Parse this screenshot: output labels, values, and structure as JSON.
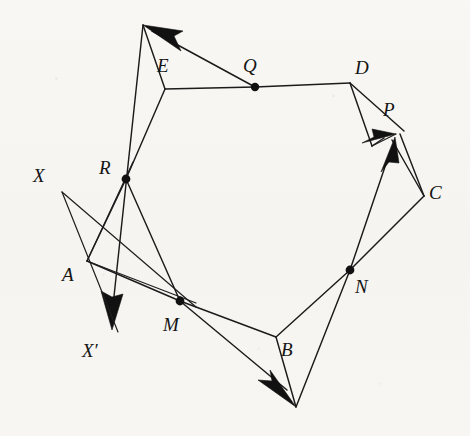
{
  "figure": {
    "width": 470,
    "height": 436,
    "background_color": "#f7f6f3",
    "ink_color": "#111111"
  },
  "labels": [
    {
      "id": "E",
      "text": "E",
      "x": 157,
      "y": 56,
      "italic": true
    },
    {
      "id": "Q",
      "text": "Q",
      "x": 243,
      "y": 56,
      "italic": true
    },
    {
      "id": "D",
      "text": "D",
      "x": 355,
      "y": 58,
      "italic": true
    },
    {
      "id": "P",
      "text": "P",
      "x": 383,
      "y": 100,
      "italic": true
    },
    {
      "id": "C",
      "text": "C",
      "x": 429,
      "y": 183,
      "italic": true
    },
    {
      "id": "N",
      "text": "N",
      "x": 355,
      "y": 277,
      "italic": true
    },
    {
      "id": "B",
      "text": "B",
      "x": 281,
      "y": 340,
      "italic": true
    },
    {
      "id": "M",
      "text": "M",
      "x": 163,
      "y": 315,
      "italic": true
    },
    {
      "id": "A",
      "text": "A",
      "x": 62,
      "y": 265,
      "italic": true
    },
    {
      "id": "R",
      "text": "R",
      "x": 99,
      "y": 158,
      "italic": true
    },
    {
      "id": "X",
      "text": "X",
      "x": 33,
      "y": 166,
      "italic": true
    },
    {
      "id": "Xp",
      "text": "X′",
      "x": 82,
      "y": 341,
      "italic": true
    }
  ],
  "points": {
    "apex_top": {
      "x": 143,
      "y": 25,
      "name": "top-apex"
    },
    "E": {
      "x": 165,
      "y": 89,
      "name": "vertex-E"
    },
    "Q": {
      "x": 255,
      "y": 87,
      "name": "midpoint-Q"
    },
    "D": {
      "x": 350,
      "y": 83,
      "name": "vertex-D"
    },
    "P": {
      "x": 395,
      "y": 137,
      "name": "point-P"
    },
    "P_left": {
      "x": 372,
      "y": 146,
      "name": "point-P-left"
    },
    "C": {
      "x": 424,
      "y": 196,
      "name": "vertex-C"
    },
    "N": {
      "x": 350,
      "y": 270,
      "name": "midpoint-N"
    },
    "B": {
      "x": 276,
      "y": 337,
      "name": "vertex-B"
    },
    "bottom_apex": {
      "x": 296,
      "y": 407,
      "name": "bottom-apex"
    },
    "M": {
      "x": 180,
      "y": 301,
      "name": "midpoint-M"
    },
    "A": {
      "x": 87,
      "y": 261,
      "name": "vertex-A"
    },
    "R": {
      "x": 126,
      "y": 179,
      "name": "midpoint-R"
    },
    "X": {
      "x": 62,
      "y": 192,
      "name": "ray-origin-X"
    },
    "Xprime": {
      "x": 112,
      "y": 330,
      "name": "ray-tip-X-prime"
    }
  },
  "dots": [
    {
      "id": "Q",
      "x": 255,
      "y": 87,
      "r": 4.2
    },
    {
      "id": "R",
      "x": 126,
      "y": 179,
      "r": 4.4
    },
    {
      "id": "M",
      "x": 180,
      "y": 301,
      "r": 4.4
    },
    {
      "id": "N",
      "x": 350,
      "y": 270,
      "r": 4.4
    }
  ],
  "polygon_edges": [
    {
      "id": "E-Q-D",
      "from": "E",
      "to": "D",
      "via": "Q"
    },
    {
      "id": "D-P",
      "from": "D",
      "to": "P_left"
    },
    {
      "id": "P-C",
      "from": "P",
      "to": "C"
    },
    {
      "id": "C-N-B",
      "from": "C",
      "to": "B",
      "via": "N"
    },
    {
      "id": "B-M-A",
      "from": "B",
      "to": "A",
      "via": "M"
    },
    {
      "id": "A-R-E",
      "from": "A",
      "to": "E",
      "via": "R"
    }
  ],
  "directed_arrows": [
    {
      "id": "arrow-to-top-apex",
      "from": "Q",
      "to": "apex_top",
      "label": "Q to top apex"
    },
    {
      "id": "arrow-to-X-prime",
      "from": "apex_top",
      "to": "Xprime",
      "label": "top apex to X-prime"
    },
    {
      "id": "arrow-to-bottom",
      "from": "M",
      "to": "bottom_apex",
      "label": "M to bottom apex"
    },
    {
      "id": "arrow-to-P-from-D",
      "from": "D",
      "to": "P",
      "label": "D side to P"
    },
    {
      "id": "arrow-to-P-from-N",
      "from": "N",
      "to": "P",
      "label": "N to P"
    }
  ],
  "auxiliary_lines": [
    {
      "id": "X-to-A-extend",
      "from": "X",
      "to": "Xprime_side",
      "desc": "ray from X through A downward"
    },
    {
      "id": "X-to-M",
      "from": "X",
      "to": "M",
      "desc": "ray from X toward M"
    },
    {
      "id": "A-to-R-up",
      "from": "A",
      "to": "R",
      "desc": "segment A to R"
    },
    {
      "id": "D-to-C",
      "from": "D",
      "to": "C",
      "desc": "segment D to C"
    },
    {
      "id": "B-to-bottom",
      "from": "B",
      "to": "bottom_apex",
      "desc": "segment B to bottom apex"
    },
    {
      "id": "N-to-bottom",
      "from": "N",
      "to": "bottom_apex",
      "desc": "segment N to bottom apex"
    },
    {
      "id": "apex-to-E",
      "from": "apex_top",
      "to": "E",
      "desc": "segment top apex to E"
    }
  ]
}
